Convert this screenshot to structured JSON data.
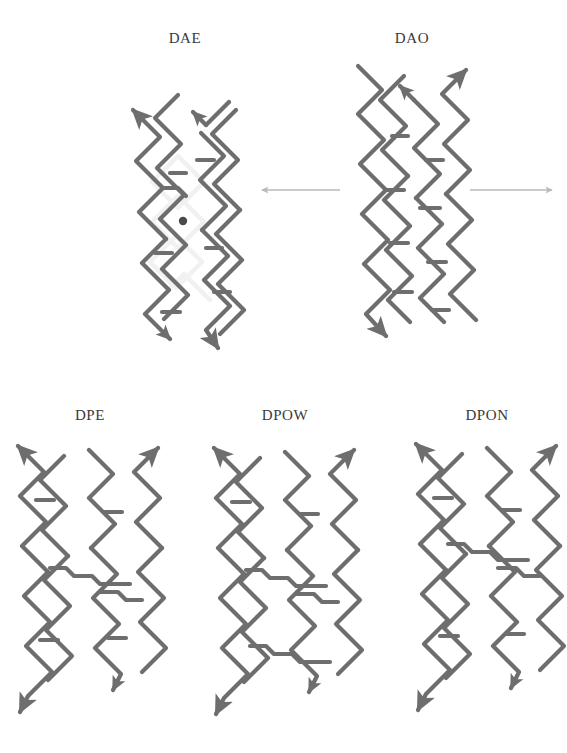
{
  "figure": {
    "background_color": "#ffffff",
    "strand_color": "#6e6e6e",
    "faint_strand_color": "#f1f1f1",
    "transition_arrow_color": "#b9b9b9",
    "label_color": "#3a3a3a",
    "marker_color": "#4a4a4a"
  },
  "motifs": [
    {
      "id": "dae",
      "label": "DAE",
      "label_x": 185,
      "label_y": 30,
      "center_x": 185,
      "center_y": 215,
      "row": "top",
      "has_center_marker": true,
      "has_faint_strands": true,
      "crossovers": 2,
      "arrow_directions": [
        "up-left",
        "up-right",
        "down-left",
        "down-right"
      ]
    },
    {
      "id": "dao",
      "label": "DAO",
      "label_x": 412,
      "label_y": 30,
      "center_x": 412,
      "center_y": 210,
      "row": "top",
      "has_center_marker": false,
      "has_faint_strands": false,
      "crossovers": 2,
      "arrow_directions": [
        "up-left",
        "up-right",
        "down-left",
        "down-right"
      ]
    },
    {
      "id": "dpe",
      "label": "DPE",
      "label_x": 90,
      "label_y": 407,
      "center_x": 90,
      "center_y": 585,
      "row": "bottom",
      "has_center_marker": false,
      "has_faint_strands": false,
      "crossovers": 1,
      "arrow_directions": [
        "up-left",
        "up-right",
        "down-left",
        "down-right"
      ]
    },
    {
      "id": "dpow",
      "label": "DPOW",
      "label_x": 285,
      "label_y": 407,
      "center_x": 285,
      "center_y": 585,
      "row": "bottom",
      "has_center_marker": false,
      "has_faint_strands": false,
      "crossovers": 2,
      "arrow_directions": [
        "up-left",
        "up-right",
        "down-left",
        "down-right"
      ]
    },
    {
      "id": "dpon",
      "label": "DPON",
      "label_x": 487,
      "label_y": 407,
      "center_x": 487,
      "center_y": 578,
      "row": "bottom",
      "has_center_marker": false,
      "has_faint_strands": false,
      "crossovers": 2,
      "arrow_directions": [
        "up-left",
        "up-right",
        "down-left",
        "down-right"
      ]
    }
  ],
  "transition_arrows": [
    {
      "id": "arrow-left",
      "direction": "left",
      "x1": 340,
      "x2": 262,
      "y": 190
    },
    {
      "id": "arrow-right",
      "direction": "right",
      "x1": 470,
      "x2": 552,
      "y": 190
    }
  ]
}
